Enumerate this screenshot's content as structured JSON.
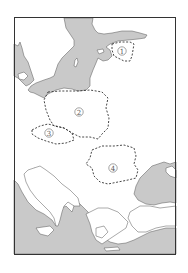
{
  "map": {
    "type": "outline map",
    "area_shown": "Central and Eastern Europe, Baltic Sea to Mediterranean",
    "legend_style": {
      "sea_color": "#c9c9c9",
      "land_color": "#ffffff",
      "border_style": "dashed"
    },
    "markers": [
      {
        "id": "1",
        "label": "①",
        "x": 122,
        "y": 51
      },
      {
        "id": "2",
        "label": "②",
        "x": 79,
        "y": 112
      },
      {
        "id": "3",
        "label": "③",
        "x": 49,
        "y": 133
      },
      {
        "id": "4",
        "label": "④",
        "x": 113,
        "y": 168
      }
    ]
  }
}
